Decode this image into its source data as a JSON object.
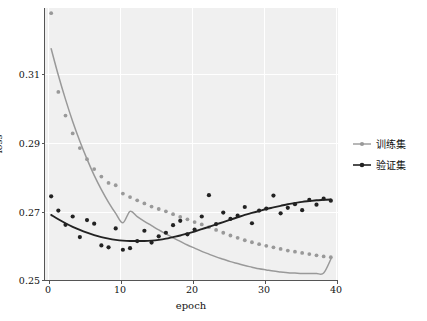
{
  "chart_data": {
    "type": "scatter",
    "title": "",
    "xlabel": "epoch",
    "ylabel": "loss",
    "xlim": [
      0,
      41
    ],
    "ylim": [
      0.2485,
      0.3175
    ],
    "xticks": [
      "0",
      "10",
      "20",
      "30",
      "40"
    ],
    "xtick_values": [
      0,
      10,
      20,
      30,
      40
    ],
    "yticks": [
      "0.25",
      "0.27",
      "0.29",
      "0.31"
    ],
    "ytick_values": [
      0.25,
      0.27,
      0.29,
      0.31
    ],
    "grid": true,
    "grid_color": "#ffffff",
    "axes_facecolor": "#f0f0f0",
    "legend_position": "outside-right",
    "series": [
      {
        "name": "训练集",
        "color": "#999999",
        "marker": "o",
        "x": [
          1,
          2,
          3,
          4,
          5,
          6,
          7,
          8,
          9,
          10,
          11,
          12,
          13,
          14,
          15,
          16,
          17,
          18,
          19,
          20,
          21,
          22,
          23,
          24,
          25,
          26,
          27,
          28,
          29,
          30,
          31,
          32,
          33,
          34,
          35,
          36,
          37,
          38,
          39,
          40
        ],
        "y": [
          0.3162,
          0.2963,
          0.2903,
          0.2858,
          0.2821,
          0.2793,
          0.2768,
          0.2749,
          0.2733,
          0.2727,
          0.2706,
          0.2697,
          0.2689,
          0.2681,
          0.2673,
          0.2667,
          0.2661,
          0.2654,
          0.2647,
          0.2641,
          0.2634,
          0.2628,
          0.2621,
          0.2614,
          0.2607,
          0.26,
          0.2594,
          0.2588,
          0.2583,
          0.2578,
          0.2574,
          0.257,
          0.2566,
          0.2562,
          0.2559,
          0.2556,
          0.2553,
          0.255,
          0.2547,
          0.2545
        ],
        "trend_y": [
          0.3072,
          0.3005,
          0.2944,
          0.2888,
          0.2838,
          0.2793,
          0.2752,
          0.2716,
          0.2684,
          0.2656,
          0.2632,
          0.2661,
          0.2648,
          0.2636,
          0.2625,
          0.2614,
          0.2604,
          0.2594,
          0.2585,
          0.2576,
          0.2568,
          0.256,
          0.2553,
          0.2546,
          0.254,
          0.2534,
          0.2529,
          0.2524,
          0.252,
          0.2516,
          0.2513,
          0.251,
          0.2508,
          0.2506,
          0.2505,
          0.2504,
          0.2504,
          0.2504,
          0.2505,
          0.254
        ]
      },
      {
        "name": "验证集",
        "color": "#222222",
        "marker": "o",
        "x": [
          1,
          2,
          3,
          4,
          5,
          6,
          7,
          8,
          9,
          10,
          11,
          12,
          13,
          14,
          15,
          16,
          17,
          18,
          19,
          20,
          21,
          22,
          23,
          24,
          25,
          26,
          27,
          28,
          29,
          30,
          31,
          32,
          33,
          34,
          35,
          36,
          37,
          38,
          39,
          40
        ],
        "y": [
          0.2699,
          0.2663,
          0.2627,
          0.2648,
          0.2596,
          0.2639,
          0.263,
          0.2575,
          0.257,
          0.2618,
          0.2564,
          0.2568,
          0.2586,
          0.2612,
          0.2582,
          0.2598,
          0.2607,
          0.2626,
          0.2637,
          0.2603,
          0.2615,
          0.2648,
          0.2702,
          0.2629,
          0.2658,
          0.2642,
          0.265,
          0.2672,
          0.2631,
          0.2663,
          0.2668,
          0.2701,
          0.2656,
          0.267,
          0.2679,
          0.2664,
          0.269,
          0.2678,
          0.2693,
          0.2688
        ],
        "trend_y": [
          0.2652,
          0.2641,
          0.2631,
          0.2622,
          0.2614,
          0.2607,
          0.2601,
          0.2596,
          0.2592,
          0.2589,
          0.2587,
          0.2586,
          0.2586,
          0.2586,
          0.2587,
          0.2589,
          0.2592,
          0.2596,
          0.26,
          0.2605,
          0.261,
          0.2616,
          0.2622,
          0.2628,
          0.2634,
          0.264,
          0.2646,
          0.2652,
          0.2657,
          0.2662,
          0.2667,
          0.2671,
          0.2675,
          0.2679,
          0.2682,
          0.2685,
          0.2687,
          0.2689,
          0.269,
          0.2691
        ]
      }
    ]
  },
  "legend": {
    "entries": [
      {
        "label": "训练集",
        "color": "#999999"
      },
      {
        "label": "验证集",
        "color": "#222222"
      }
    ]
  }
}
